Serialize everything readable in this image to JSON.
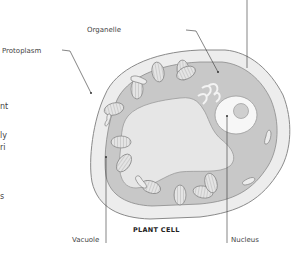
{
  "diagram": {
    "title": "PLANT CELL",
    "labels": {
      "organelle": "Organelle",
      "protoplasm": "Protoplasm",
      "vacuole": "Vacuole",
      "nucleus": "Nucleus"
    },
    "side_text_fragments": [
      "nt",
      "ly",
      "ri",
      "s"
    ],
    "colors": {
      "cell_wall_fill": "#ededed",
      "cell_wall_stroke": "#8a8a8a",
      "cytoplasm_fill": "#c8c8c8",
      "vacuole_fill": "#e6e6e6",
      "nucleus_fill": "#f7f7f7",
      "nucleolus_fill": "#cfcfcf",
      "leader_line": "#333333"
    }
  }
}
